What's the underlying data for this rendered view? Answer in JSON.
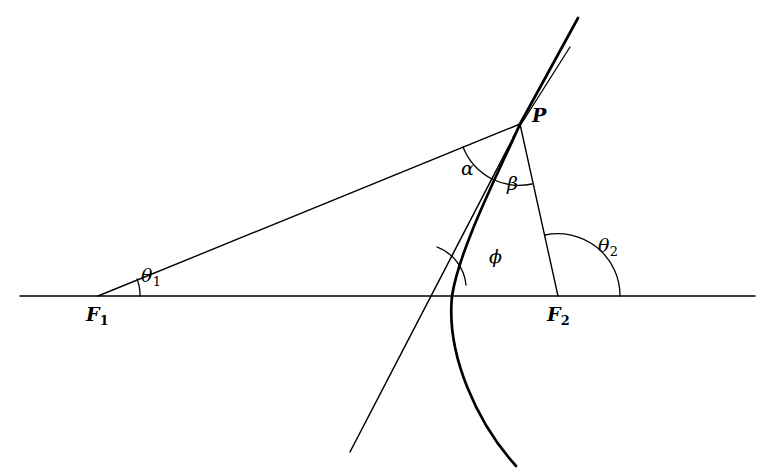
{
  "figure": {
    "type": "geometry-diagram",
    "background_color": "#ffffff",
    "stroke_color": "#000000",
    "canvas": {
      "width": 768,
      "height": 476
    }
  },
  "points": {
    "F1": {
      "label": "F",
      "subscript": "1",
      "x": 98,
      "y": 296,
      "label_x": 86,
      "label_y": 305
    },
    "F2": {
      "label": "F",
      "subscript": "2",
      "x": 558,
      "y": 296,
      "label_x": 547,
      "label_y": 305
    },
    "P": {
      "label": "P",
      "subscript": "",
      "x": 520,
      "y": 124,
      "label_x": 532,
      "label_y": 106
    }
  },
  "angles": {
    "theta1": {
      "label": "θ",
      "subscript": "1",
      "label_x": 141,
      "label_y": 266,
      "vertex": "F1",
      "radius": 42
    },
    "theta2": {
      "label": "θ",
      "subscript": "2",
      "label_x": 598,
      "label_y": 236,
      "vertex": "F2",
      "radius": 62
    },
    "alpha": {
      "label": "α",
      "subscript": "",
      "label_x": 461,
      "label_y": 159,
      "vertex": "P",
      "radius": 62
    },
    "beta": {
      "label": "β",
      "subscript": "",
      "label_x": 507,
      "label_y": 174,
      "vertex": "P",
      "radius": 62
    },
    "phi": {
      "label": "ϕ",
      "subscript": "",
      "label_x": 489,
      "label_y": 247,
      "vertex": "curve-axis-intersection",
      "radius": 45
    }
  },
  "axis": {
    "name": "horizontal-axis",
    "x_start": 20,
    "x_end": 755,
    "y": 296
  },
  "curve": {
    "name": "conic-branch",
    "through_point": "P",
    "stroke_width": 2.6
  },
  "tangent": {
    "name": "tangent-line-at-P",
    "stroke_width": 1.2
  }
}
